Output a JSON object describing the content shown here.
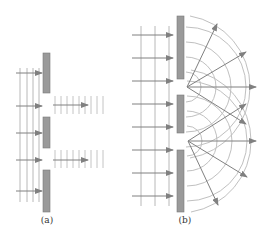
{
  "figure": {
    "panels": [
      {
        "id": "a",
        "label": "(a)",
        "description": "Plane waves passing through narrow openings without diffraction"
      },
      {
        "id": "b",
        "label": "(b)",
        "description": "Plane waves diffracting through slits producing circular wavefronts"
      }
    ],
    "colors": {
      "barrier": "#9a9a9a",
      "barrier_edge": "#7a7a7a",
      "wavefront": "#b8b8b8",
      "arrow": "#808080",
      "background": "#ffffff"
    }
  }
}
